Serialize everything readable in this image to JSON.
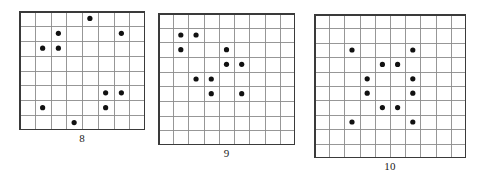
{
  "figure": {
    "background_color": "#ffffff",
    "grid_line_color": "#8c8c8c",
    "grid_border_color": "#3a3a3a",
    "dot_color": "#111111",
    "caption_color": "#1a1a1a",
    "panels": [
      {
        "id": "panel-8",
        "caption": "8",
        "size": 8,
        "rows": 8,
        "cols": 8,
        "x": 19,
        "y": 11,
        "width": 126,
        "height": 119,
        "caption_y": 132,
        "dot_radius": 2.6,
        "dots": [
          {
            "row": 0,
            "col": 4
          },
          {
            "row": 1,
            "col": 2
          },
          {
            "row": 1,
            "col": 6
          },
          {
            "row": 2,
            "col": 1
          },
          {
            "row": 2,
            "col": 2
          },
          {
            "row": 5,
            "col": 5
          },
          {
            "row": 5,
            "col": 6
          },
          {
            "row": 6,
            "col": 1
          },
          {
            "row": 6,
            "col": 5
          },
          {
            "row": 7,
            "col": 3
          }
        ]
      },
      {
        "id": "panel-9",
        "caption": "9",
        "size": 9,
        "rows": 9,
        "cols": 9,
        "x": 158,
        "y": 13,
        "width": 137,
        "height": 132,
        "caption_y": 147,
        "dot_radius": 2.6,
        "dots": [
          {
            "row": 1,
            "col": 1
          },
          {
            "row": 1,
            "col": 2
          },
          {
            "row": 2,
            "col": 1
          },
          {
            "row": 2,
            "col": 4
          },
          {
            "row": 3,
            "col": 4
          },
          {
            "row": 3,
            "col": 5
          },
          {
            "row": 4,
            "col": 2
          },
          {
            "row": 4,
            "col": 3
          },
          {
            "row": 5,
            "col": 3
          },
          {
            "row": 5,
            "col": 5
          }
        ]
      },
      {
        "id": "panel-10",
        "caption": "10",
        "size": 10,
        "rows": 10,
        "cols": 10,
        "x": 314,
        "y": 14,
        "width": 152,
        "height": 144,
        "caption_y": 160,
        "dot_radius": 2.6,
        "dots": [
          {
            "row": 2,
            "col": 2
          },
          {
            "row": 2,
            "col": 6
          },
          {
            "row": 3,
            "col": 4
          },
          {
            "row": 3,
            "col": 5
          },
          {
            "row": 4,
            "col": 3
          },
          {
            "row": 4,
            "col": 6
          },
          {
            "row": 5,
            "col": 3
          },
          {
            "row": 5,
            "col": 6
          },
          {
            "row": 6,
            "col": 4
          },
          {
            "row": 6,
            "col": 5
          },
          {
            "row": 7,
            "col": 2
          },
          {
            "row": 7,
            "col": 6
          }
        ]
      }
    ]
  },
  "chart_data": {
    "type": "scatter",
    "title": "",
    "xlabel": "",
    "ylabel": "",
    "grid": true,
    "legend": "none",
    "panels": [
      {
        "name": "8",
        "grid_size": [
          8,
          8
        ],
        "xlim": [
          0,
          8
        ],
        "ylim": [
          0,
          8
        ],
        "points": [
          [
            4,
            0
          ],
          [
            2,
            1
          ],
          [
            6,
            1
          ],
          [
            1,
            2
          ],
          [
            2,
            2
          ],
          [
            5,
            5
          ],
          [
            6,
            5
          ],
          [
            1,
            6
          ],
          [
            5,
            6
          ],
          [
            3,
            7
          ]
        ],
        "n_points": 10
      },
      {
        "name": "9",
        "grid_size": [
          9,
          9
        ],
        "xlim": [
          0,
          9
        ],
        "ylim": [
          0,
          9
        ],
        "points": [
          [
            1,
            1
          ],
          [
            2,
            1
          ],
          [
            1,
            2
          ],
          [
            4,
            2
          ],
          [
            4,
            3
          ],
          [
            5,
            3
          ],
          [
            2,
            4
          ],
          [
            3,
            4
          ],
          [
            3,
            5
          ],
          [
            5,
            5
          ]
        ],
        "n_points": 10
      },
      {
        "name": "10",
        "grid_size": [
          10,
          10
        ],
        "xlim": [
          0,
          10
        ],
        "ylim": [
          0,
          10
        ],
        "points": [
          [
            2,
            2
          ],
          [
            6,
            2
          ],
          [
            4,
            3
          ],
          [
            5,
            3
          ],
          [
            3,
            4
          ],
          [
            6,
            4
          ],
          [
            3,
            5
          ],
          [
            6,
            5
          ],
          [
            4,
            6
          ],
          [
            5,
            6
          ],
          [
            2,
            7
          ],
          [
            6,
            7
          ]
        ],
        "n_points": 12
      }
    ]
  }
}
